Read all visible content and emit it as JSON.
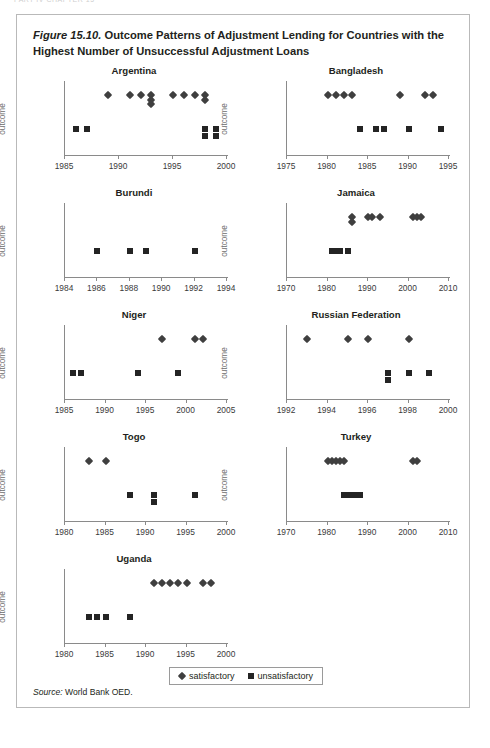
{
  "running_head": "PART IV  CHAPTER 15",
  "figure": {
    "number": "Figure 15.10.",
    "title": "Outcome Patterns of Adjustment Lending for Countries with the Highest Number of Unsuccessful Adjustment Loans",
    "source_label": "Source:",
    "source_text": " World Bank OED."
  },
  "legend": {
    "satisfactory": "satisfactory",
    "unsatisfactory": "unsatisfactory"
  },
  "axis": {
    "ylabel": "outcome"
  },
  "chart_data": {
    "type": "scatter",
    "title": "Outcome Patterns of Adjustment Lending for Countries with the Highest Number of Unsuccessful Adjustment Loans",
    "xlabel": "",
    "ylabel": "outcome",
    "grid": false,
    "legend_position": "bottom-center",
    "series_names": [
      "satisfactory",
      "unsatisfactory"
    ],
    "marker_satisfactory": "diamond",
    "marker_unsatisfactory": "square",
    "y_levels": {
      "satisfactory": 2,
      "unsatisfactory": 1
    },
    "panels": [
      {
        "name": "Argentina",
        "xlim": [
          1985,
          2000
        ],
        "xticks": [
          1985,
          1990,
          1995,
          2000
        ],
        "satisfactory": [
          1989,
          1991,
          1992,
          1993,
          1993,
          1993,
          1995,
          1996,
          1997,
          1998,
          1998
        ],
        "unsatisfactory": [
          1986,
          1987,
          1998,
          1998,
          1999,
          1999
        ]
      },
      {
        "name": "Bangladesh",
        "xlim": [
          1975,
          1995
        ],
        "xticks": [
          1975,
          1980,
          1985,
          1990,
          1995
        ],
        "satisfactory": [
          1980,
          1981,
          1982,
          1983,
          1989,
          1992,
          1993
        ],
        "unsatisfactory": [
          1984,
          1986,
          1987,
          1990,
          1994
        ]
      },
      {
        "name": "Burundi",
        "xlim": [
          1984,
          1994
        ],
        "xticks": [
          1984,
          1986,
          1988,
          1990,
          1992,
          1994
        ],
        "satisfactory": [],
        "unsatisfactory": [
          1986,
          1988,
          1989,
          1992
        ]
      },
      {
        "name": "Jamaica",
        "xlim": [
          1970,
          2010
        ],
        "xticks": [
          1970,
          1980,
          1990,
          2000,
          2010
        ],
        "satisfactory": [
          1986,
          1986,
          1990,
          1991,
          1993,
          2001,
          2002,
          2003
        ],
        "unsatisfactory": [
          1981,
          1982,
          1983,
          1985
        ]
      },
      {
        "name": "Niger",
        "xlim": [
          1985,
          2005
        ],
        "xticks": [
          1985,
          1990,
          1995,
          2000,
          2005
        ],
        "satisfactory": [
          1997,
          2001,
          2002
        ],
        "unsatisfactory": [
          1986,
          1987,
          1994,
          1999
        ]
      },
      {
        "name": "Russian Federation",
        "xlim": [
          1992,
          2000
        ],
        "xticks": [
          1992,
          1994,
          1996,
          1998,
          2000
        ],
        "satisfactory": [
          1993,
          1995,
          1996,
          1998
        ],
        "unsatisfactory": [
          1997,
          1997,
          1998,
          1999
        ]
      },
      {
        "name": "Togo",
        "xlim": [
          1980,
          2000
        ],
        "xticks": [
          1980,
          1985,
          1990,
          1995,
          2000
        ],
        "satisfactory": [
          1983,
          1985
        ],
        "unsatisfactory": [
          1988,
          1991,
          1991,
          1996
        ]
      },
      {
        "name": "Turkey",
        "xlim": [
          1970,
          2010
        ],
        "xticks": [
          1970,
          1980,
          1990,
          2000,
          2010
        ],
        "satisfactory": [
          1980,
          1981,
          1982,
          1983,
          1984,
          2001,
          2002
        ],
        "unsatisfactory": [
          1984,
          1985,
          1986,
          1987,
          1988
        ]
      },
      {
        "name": "Uganda",
        "xlim": [
          1980,
          2000
        ],
        "xticks": [
          1980,
          1985,
          1990,
          1995,
          2000
        ],
        "satisfactory": [
          1991,
          1992,
          1993,
          1994,
          1995,
          1997,
          1998
        ],
        "unsatisfactory": [
          1983,
          1984,
          1985,
          1988
        ]
      }
    ]
  }
}
